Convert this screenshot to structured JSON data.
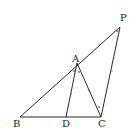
{
  "figure": {
    "points": {
      "P": {
        "label": "P",
        "x": 120,
        "y": 27
      },
      "A": {
        "label": "A",
        "x": 77,
        "y": 63
      },
      "B": {
        "label": "B",
        "x": 20,
        "y": 117
      },
      "D": {
        "label": "D",
        "x": 66,
        "y": 117
      },
      "C": {
        "label": "C",
        "x": 101,
        "y": 117
      }
    },
    "segments": [
      [
        "B",
        "P"
      ],
      [
        "B",
        "C"
      ],
      [
        "A",
        "D"
      ],
      [
        "A",
        "C"
      ],
      [
        "C",
        "P"
      ]
    ],
    "labels": {
      "P": "P",
      "A": "A",
      "B": "B",
      "D": "D",
      "C": "C"
    },
    "marks": [
      "angle marks at A (BAD, DAC)",
      "angle mark at C (ACP)",
      "angle mark at P (APC)",
      "tick marks on AP, PC, AD"
    ],
    "colors": {
      "line": "#2a2a2a",
      "text": "#222222",
      "background": "#ffffff"
    }
  }
}
